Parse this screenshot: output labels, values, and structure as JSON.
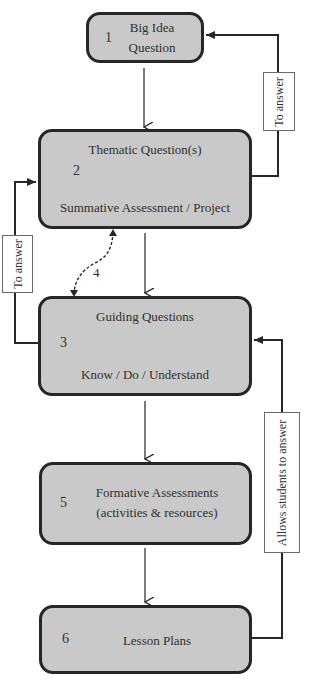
{
  "diagram": {
    "nodes": [
      {
        "id": "1",
        "number": "1",
        "lines": [
          "Big Idea",
          "Question"
        ]
      },
      {
        "id": "2",
        "number": "2",
        "top": "Thematic Question(s)",
        "bottom": "Summative Assessment / Project"
      },
      {
        "id": "3",
        "number": "3",
        "top": "Guiding Questions",
        "bottom": "Know / Do / Understand"
      },
      {
        "id": "5",
        "number": "5",
        "lines": [
          "Formative Assessments",
          "(activities & resources)"
        ]
      },
      {
        "id": "6",
        "number": "6",
        "lines": [
          "Lesson Plans"
        ]
      }
    ],
    "edge_labels": {
      "right_top": "To answer",
      "left_mid": "To answer",
      "right_bottom": "Allows students to answer",
      "dashed_step": "4"
    },
    "edges": [
      {
        "from": "1",
        "to": "2",
        "style": "solid"
      },
      {
        "from": "2",
        "to": "3",
        "style": "solid"
      },
      {
        "from": "3",
        "to": "5",
        "style": "solid"
      },
      {
        "from": "5",
        "to": "6",
        "style": "solid"
      },
      {
        "from": "2",
        "to": "1",
        "style": "solid",
        "label": "To answer"
      },
      {
        "from": "3",
        "to": "2",
        "style": "solid",
        "label": "To answer"
      },
      {
        "from": "6",
        "to": "3",
        "style": "solid",
        "label": "Allows students to answer"
      },
      {
        "from": "2",
        "to": "3",
        "style": "dashed-bidirectional",
        "label": "4"
      }
    ],
    "colors": {
      "box_fill": "#c9c9c9",
      "stroke": "#262626",
      "label_fill": "#ffffff"
    }
  }
}
